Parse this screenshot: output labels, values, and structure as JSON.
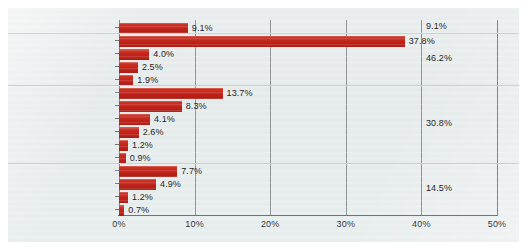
{
  "chart_data": {
    "type": "bar",
    "orientation": "horizontal",
    "title": "",
    "xlabel": "",
    "ylabel": "",
    "xlim": [
      0,
      50
    ],
    "xticks": [
      "0%",
      "10%",
      "20%",
      "30%",
      "40%",
      "50%"
    ],
    "xtick_values": [
      0,
      10,
      20,
      30,
      40,
      50
    ],
    "grid": true,
    "legend": "none",
    "bar_color": "#BF2118",
    "separator_color": "#D8D49A",
    "background_color": "#E8EDED",
    "categories": [
      "TEC/OPS/HUM/SOC",
      "OPS/HUM/SOC",
      "TEC/OPS/SOC",
      "TEC/OPS/HUM",
      "TEC/HUM/SOC",
      "HUM/SOC",
      "OPS/HUM",
      "TEC/OPS",
      "TEC/SOC",
      "OPS/SOC",
      "TEC/HUM",
      "TEC",
      "HUM",
      "OPS",
      "SOC ONLY"
    ],
    "values": [
      9.1,
      37.8,
      4.0,
      2.5,
      1.9,
      13.7,
      8.3,
      4.1,
      2.6,
      1.2,
      0.9,
      7.7,
      4.9,
      1.2,
      0.7
    ],
    "value_labels": [
      "9.1%",
      "37.8%",
      "4.0%",
      "2.5%",
      "1.9%",
      "13.7%",
      "8.3%",
      "4.1%",
      "2.6%",
      "1.2%",
      "0.9%",
      "7.7%",
      "4.9%",
      "1.2%",
      "0.7%"
    ],
    "groups": [
      {
        "total_label": "9.1%",
        "total": 9.1,
        "rows": 1,
        "member_categories": [
          "TEC/OPS/HUM/SOC"
        ]
      },
      {
        "total_label": "46.2%",
        "total": 46.2,
        "rows": 4,
        "member_categories": [
          "OPS/HUM/SOC",
          "TEC/OPS/SOC",
          "TEC/OPS/HUM",
          "TEC/HUM/SOC"
        ]
      },
      {
        "total_label": "30.8%",
        "total": 30.8,
        "rows": 6,
        "member_categories": [
          "HUM/SOC",
          "OPS/HUM",
          "TEC/OPS",
          "TEC/SOC",
          "OPS/SOC",
          "TEC/HUM"
        ]
      },
      {
        "total_label": "14.5%",
        "total": 14.5,
        "rows": 4,
        "member_categories": [
          "TEC",
          "HUM",
          "OPS",
          "SOC ONLY"
        ]
      }
    ]
  }
}
